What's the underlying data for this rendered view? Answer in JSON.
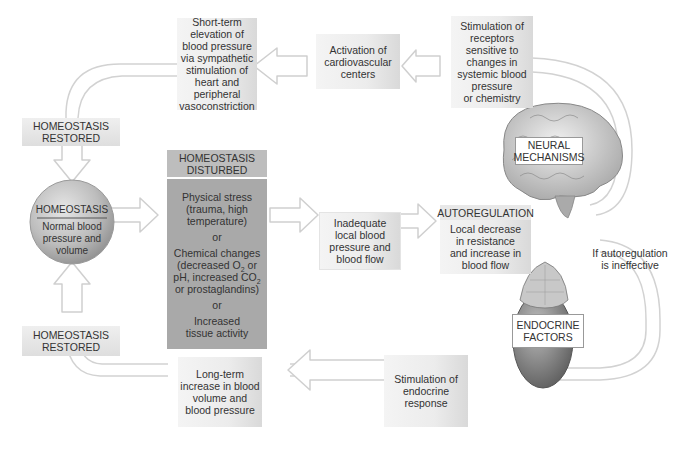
{
  "diagram": {
    "central_node": {
      "header": "HOMEOSTASIS",
      "body": "Normal blood pressure and volume"
    },
    "restored_top": {
      "line1": "HOMEOSTASIS",
      "line2": "RESTORED"
    },
    "restored_bottom": {
      "line1": "HOMEOSTASIS",
      "line2": "RESTORED"
    },
    "disturbed": {
      "header_line1": "HOMEOSTASIS",
      "header_line2": "DISTURBED",
      "cause1": [
        "Physical stress",
        "(trauma, high",
        "temperature)"
      ],
      "or1": "or",
      "cause2": {
        "line1": "Chemical changes",
        "line2_pre": "(decreased O",
        "line2_sub": "2",
        "line2_post": " or",
        "line3_pre": "pH, increased CO",
        "line3_sub": "2",
        "line4": "or prostaglandins)"
      },
      "or2": "or",
      "cause3": [
        "Increased",
        "tissue activity"
      ]
    },
    "inadequate": [
      "Inadequate",
      "local blood",
      "pressure and",
      "blood flow"
    ],
    "autoregulation": {
      "header": "AUTOREGULATION",
      "body": [
        "Local decrease",
        "in resistance",
        "and increase in",
        "blood flow"
      ]
    },
    "if_ineffective": [
      "If autoregulation",
      "is ineffective"
    ],
    "neural": {
      "label_line1": "NEURAL",
      "label_line2": "MECHANISMS",
      "receptors": [
        "Stimulation of",
        "receptors",
        "sensitive to",
        "changes in",
        "systemic blood",
        "pressure",
        "or chemistry"
      ],
      "activation": [
        "Activation of",
        "cardiovascular",
        "centers"
      ],
      "short_term": [
        "Short-term",
        "elevation of",
        "blood pressure",
        "via sympathetic",
        "stimulation of",
        "heart and",
        "peripheral",
        "vasoconstriction"
      ]
    },
    "endocrine": {
      "label_line1": "ENDOCRINE",
      "label_line2": "FACTORS",
      "stimulation": [
        "Stimulation of",
        "endocrine",
        "response"
      ],
      "long_term": [
        "Long-term",
        "increase in blood",
        "volume and",
        "blood pressure"
      ]
    },
    "icons": [
      "brain-illustration",
      "adrenal-kidney-illustration",
      "flow-arrows"
    ],
    "colors": {
      "box_light": "#ececec",
      "box_dark": "#a9a9a9",
      "arrow_fill": "#ffffff",
      "arrow_stroke": "#cfcfcf",
      "sphere": "#b8b8b8",
      "brain": "#d0d0d0",
      "kidney": "#8a8a8a"
    }
  }
}
